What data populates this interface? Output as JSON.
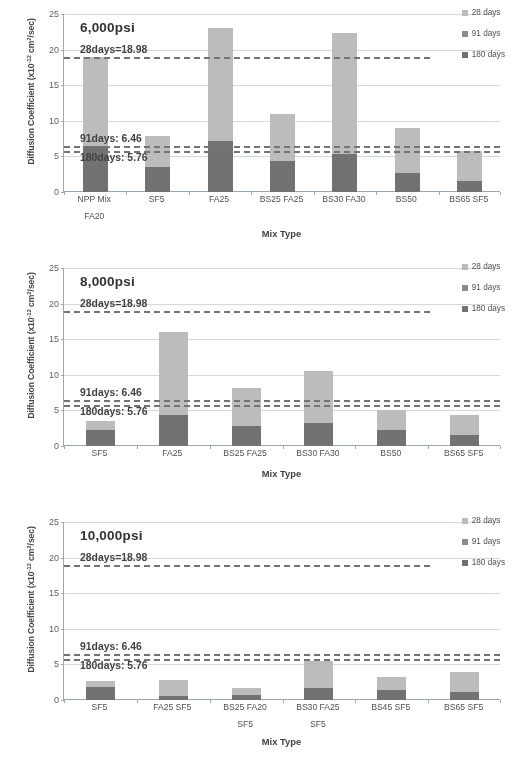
{
  "figure": {
    "axis_y_title": "Diffusion Coefficient (x10",
    "axis_y_title_sup": "-12",
    "axis_y_title_tail": " cm2/sec)",
    "axis_x_title": "Mix Type",
    "y_ticks": [
      "0",
      "5",
      "10",
      "15",
      "20",
      "25"
    ],
    "colors": {
      "d28": "#bdbdbd",
      "d91": "#8a8a8a",
      "d180": "#6e6e6e",
      "grid": "#d4dde4",
      "axis": "#9aa8b4",
      "refline": "#6f6f6f"
    },
    "legend": [
      {
        "label": "28 days",
        "color": "#bdbdbd"
      },
      {
        "label": "91 days",
        "color": "#8a8a8a"
      },
      {
        "label": "180 days",
        "color": "#6e6e6e"
      }
    ],
    "reference_lines": [
      {
        "label": "28days=18.98",
        "value": 18.98
      },
      {
        "label": "91days: 6.46",
        "value": 6.46
      },
      {
        "label": "180days: 5.76",
        "value": 5.76
      }
    ]
  },
  "chart_data": [
    {
      "type": "bar",
      "stacked": true,
      "title": "6,000psi",
      "xlabel": "Mix Type",
      "ylabel": "Diffusion Coefficient (x10-12 cm2/sec)",
      "ylim": [
        0,
        25
      ],
      "grid": true,
      "legend_position": "top-right",
      "categories": [
        "NPP Mix FA20",
        "SF5",
        "FA25",
        "BS25 FA25",
        "BS30 FA30",
        "BS50",
        "BS65 SF5"
      ],
      "category_lines": [
        [
          "NPP Mix",
          "FA20"
        ],
        [
          "SF5"
        ],
        [
          "FA25"
        ],
        [
          "BS25 FA25"
        ],
        [
          "BS30 FA30"
        ],
        [
          "BS50"
        ],
        [
          "BS65 SF5"
        ]
      ],
      "series": [
        {
          "name": "180 days",
          "values": [
            6.4,
            3.5,
            7.2,
            4.3,
            5.3,
            2.7,
            1.6
          ]
        },
        {
          "name": "28 days",
          "values": [
            12.6,
            4.3,
            15.8,
            6.7,
            17.1,
            6.3,
            4.2
          ]
        }
      ],
      "totals": [
        19.0,
        7.8,
        23.0,
        11.0,
        22.4,
        9.0,
        5.8
      ],
      "annotations": [
        {
          "text": "28days=18.98",
          "y": 18.98
        },
        {
          "text": "91days: 6.46",
          "y": 6.46
        },
        {
          "text": "180days: 5.76",
          "y": 5.76
        }
      ]
    },
    {
      "type": "bar",
      "stacked": true,
      "title": "8,000psi",
      "xlabel": "Mix Type",
      "ylabel": "Diffusion Coefficient (x10-12 cm2/sec)",
      "ylim": [
        0,
        25
      ],
      "grid": true,
      "legend_position": "top-right",
      "categories": [
        "SF5",
        "FA25",
        "BS25 FA25",
        "BS30 FA30",
        "BS50",
        "BS65 SF5"
      ],
      "category_lines": [
        [
          "SF5"
        ],
        [
          "FA25"
        ],
        [
          "BS25 FA25"
        ],
        [
          "BS30 FA30"
        ],
        [
          "BS50"
        ],
        [
          "BS65 SF5"
        ]
      ],
      "series": [
        {
          "name": "180 days",
          "values": [
            2.2,
            4.4,
            2.8,
            3.2,
            2.3,
            1.6
          ]
        },
        {
          "name": "28 days",
          "values": [
            1.3,
            11.6,
            5.4,
            7.3,
            2.7,
            2.7
          ]
        }
      ],
      "totals": [
        3.5,
        16.0,
        8.2,
        10.5,
        5.0,
        4.3
      ],
      "annotations": [
        {
          "text": "28days=18.98",
          "y": 18.98
        },
        {
          "text": "91days: 6.46",
          "y": 6.46
        },
        {
          "text": "180days: 5.76",
          "y": 5.76
        }
      ]
    },
    {
      "type": "bar",
      "stacked": true,
      "title": "10,000psi",
      "xlabel": "Mix Type",
      "ylabel": "Diffusion Coefficient (x10-12 cm2/sec)",
      "ylim": [
        0,
        25
      ],
      "grid": true,
      "legend_position": "top-right",
      "categories": [
        "SF5",
        "FA25 SF5",
        "BS25 FA20 SF5",
        "BS30 FA25 SF5",
        "BS45 SF5",
        "BS65 SF5"
      ],
      "category_lines": [
        [
          "SF5"
        ],
        [
          "FA25 SF5"
        ],
        [
          "BS25 FA20",
          "SF5"
        ],
        [
          "BS30 FA25",
          "SF5"
        ],
        [
          "BS45 SF5"
        ],
        [
          "BS65 SF5"
        ]
      ],
      "series": [
        {
          "name": "180 days",
          "values": [
            1.8,
            0.6,
            0.7,
            1.7,
            1.4,
            1.1
          ]
        },
        {
          "name": "28 days",
          "values": [
            0.9,
            2.2,
            1.0,
            3.8,
            1.8,
            2.9
          ]
        }
      ],
      "totals": [
        2.7,
        2.8,
        1.7,
        5.5,
        3.2,
        4.0
      ],
      "annotations": [
        {
          "text": "28days=18.98",
          "y": 18.98
        },
        {
          "text": "91days: 6.46",
          "y": 6.46
        },
        {
          "text": "180days: 5.76",
          "y": 5.76
        }
      ]
    }
  ]
}
